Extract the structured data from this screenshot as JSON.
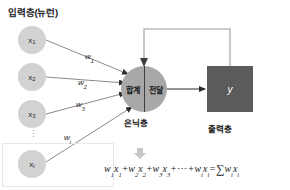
{
  "diagram": {
    "title_input_layer": "입력층(뉴런)",
    "hidden_layer_label": "은닉층",
    "output_layer_label": "출력층",
    "hidden_node": {
      "sum_text": "합계",
      "transfer_text": "전달"
    },
    "output_node": {
      "value": "y"
    },
    "input_neurons": [
      {
        "name": "x1",
        "base": "x",
        "sub": "1"
      },
      {
        "name": "x2",
        "base": "x",
        "sub": "2"
      },
      {
        "name": "x3",
        "base": "x",
        "sub": "3"
      },
      {
        "name": "xi",
        "base": "x",
        "sub": "i"
      }
    ],
    "ellipsis": "⋮",
    "weights": [
      {
        "name": "w1",
        "base": "w",
        "sub": "1"
      },
      {
        "name": "w2",
        "base": "w",
        "sub": "2"
      },
      {
        "name": "w3",
        "base": "w",
        "sub": "3"
      },
      {
        "name": "wi",
        "base": "w",
        "sub": "i"
      }
    ],
    "formula": {
      "term1_w": "w",
      "term1_w_sub": "1",
      "term1_x": "x",
      "term1_x_sub": "1",
      "plus1": "+",
      "term2_w": "w",
      "term2_w_sub": "2",
      "term2_x": "x",
      "term2_x_sub": "2",
      "plus2": "+",
      "term3_w": "w",
      "term3_w_sub": "3",
      "term3_x": "x",
      "term3_x_sub": "3",
      "plus3": "+",
      "dots": "⋯",
      "plus4": "+",
      "termi_w": "w",
      "termi_w_sub": "i",
      "termi_x": "x",
      "termi_x_sub": "i",
      "equals": "=",
      "sigma": "∑",
      "sum_w": "w",
      "sum_w_sub": "i",
      "sum_x": "x",
      "sum_x_sub": "i"
    }
  },
  "colors": {
    "input_neuron_fill": "#d2d2d2",
    "hidden_node_fill": "#a8a8a8",
    "output_node_fill": "#5b5b5b",
    "arrow_stroke": "#3d3d3d",
    "feedback_stroke": "#9a9a9a",
    "text": "#1c1c1c"
  }
}
